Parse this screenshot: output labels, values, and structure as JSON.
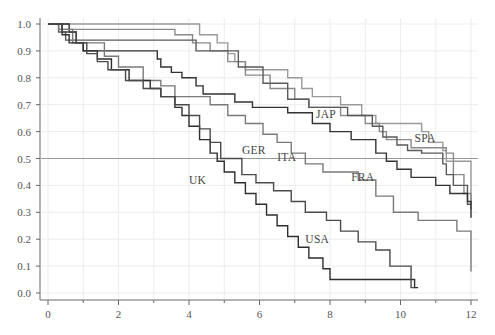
{
  "chart_data": {
    "type": "line",
    "subtype": "step (Kaplan-Meier survival curves)",
    "title": "",
    "xlabel": "",
    "ylabel": "",
    "xlim": [
      0,
      12
    ],
    "ylim": [
      0.0,
      1.0
    ],
    "x_ticks": [
      0,
      2,
      4,
      6,
      8,
      10,
      12
    ],
    "x_minor_ticks": [
      1,
      3,
      5,
      7,
      9,
      11
    ],
    "y_ticks": [
      0.0,
      0.1,
      0.2,
      0.3,
      0.4,
      0.5,
      0.6,
      0.7,
      0.8,
      0.9,
      1.0
    ],
    "x_tick_labels": [
      "0",
      "2",
      "4",
      "6",
      "8",
      "10",
      "12"
    ],
    "y_tick_labels": [
      "0.0",
      "0.1",
      "0.2",
      "0.3",
      "0.4",
      "0.5",
      "0.6",
      "0.7",
      "0.8",
      "0.9",
      "1.0"
    ],
    "grid": true,
    "reference_line": {
      "y": 0.5,
      "color": "#999999"
    },
    "legend": "inline labels",
    "series": [
      {
        "name": "JAP",
        "color": "#9a9a9a",
        "label_pos": [
          7.6,
          0.665
        ],
        "points": [
          [
            0,
            1.0
          ],
          [
            4.3,
            0.96
          ],
          [
            4.8,
            0.93
          ],
          [
            5.1,
            0.89
          ],
          [
            5.3,
            0.86
          ],
          [
            5.6,
            0.83
          ],
          [
            6.8,
            0.8
          ],
          [
            7.2,
            0.76
          ],
          [
            7.5,
            0.73
          ],
          [
            8.3,
            0.7
          ],
          [
            8.9,
            0.66
          ],
          [
            9.3,
            0.63
          ],
          [
            10.6,
            0.6
          ],
          [
            10.8,
            0.56
          ],
          [
            11.2,
            0.53
          ],
          [
            11.3,
            0.49
          ],
          [
            12.0,
            0.43
          ],
          [
            12.0,
            0.33
          ]
        ]
      },
      {
        "name": "SPA",
        "color": "#8a8a8a",
        "label_pos": [
          10.4,
          0.575
        ],
        "points": [
          [
            0,
            1.0
          ],
          [
            0.4,
            0.98
          ],
          [
            3.6,
            0.96
          ],
          [
            4.1,
            0.93
          ],
          [
            4.6,
            0.9
          ],
          [
            5.1,
            0.86
          ],
          [
            5.6,
            0.81
          ],
          [
            6.3,
            0.76
          ],
          [
            7.0,
            0.72
          ],
          [
            7.4,
            0.69
          ],
          [
            8.3,
            0.66
          ],
          [
            9.0,
            0.63
          ],
          [
            9.4,
            0.6
          ],
          [
            9.6,
            0.57
          ],
          [
            10.3,
            0.54
          ],
          [
            11.3,
            0.52
          ],
          [
            11.5,
            0.44
          ],
          [
            11.8,
            0.37
          ],
          [
            12.0,
            0.31
          ]
        ]
      },
      {
        "name": "ITA",
        "color": "#5a5a5a",
        "label_pos": [
          6.5,
          0.505
        ],
        "points": [
          [
            0,
            1.0
          ],
          [
            0.3,
            0.97
          ],
          [
            0.5,
            0.94
          ],
          [
            4.2,
            0.9
          ],
          [
            5.4,
            0.84
          ],
          [
            6.1,
            0.78
          ],
          [
            6.8,
            0.72
          ],
          [
            7.4,
            0.69
          ],
          [
            8.5,
            0.66
          ],
          [
            9.2,
            0.62
          ],
          [
            9.5,
            0.58
          ],
          [
            9.9,
            0.55
          ],
          [
            10.2,
            0.53
          ],
          [
            10.6,
            0.52
          ],
          [
            11.2,
            0.48
          ],
          [
            11.3,
            0.44
          ],
          [
            11.5,
            0.4
          ],
          [
            11.9,
            0.33
          ],
          [
            12.0,
            0.33
          ]
        ]
      },
      {
        "name": "FRA",
        "color": "#333333",
        "label_pos": [
          8.6,
          0.43
        ],
        "points": [
          [
            0,
            1.0
          ],
          [
            0.6,
            0.97
          ],
          [
            0.8,
            0.93
          ],
          [
            1.0,
            0.9
          ],
          [
            3.1,
            0.87
          ],
          [
            3.2,
            0.84
          ],
          [
            3.5,
            0.82
          ],
          [
            3.8,
            0.8
          ],
          [
            4.2,
            0.77
          ],
          [
            4.4,
            0.74
          ],
          [
            5.3,
            0.71
          ],
          [
            5.8,
            0.69
          ],
          [
            6.8,
            0.67
          ],
          [
            7.5,
            0.63
          ],
          [
            8.0,
            0.6
          ],
          [
            8.6,
            0.57
          ],
          [
            9.3,
            0.52
          ],
          [
            9.6,
            0.49
          ],
          [
            9.9,
            0.46
          ],
          [
            10.3,
            0.43
          ],
          [
            11.0,
            0.4
          ],
          [
            11.4,
            0.37
          ],
          [
            11.9,
            0.34
          ],
          [
            12.0,
            0.28
          ]
        ]
      },
      {
        "name": "GER",
        "color": "#7a7a7a",
        "label_pos": [
          5.5,
          0.53
        ],
        "points": [
          [
            0,
            1.0
          ],
          [
            0.3,
            0.98
          ],
          [
            0.7,
            0.93
          ],
          [
            1.6,
            0.88
          ],
          [
            2.0,
            0.84
          ],
          [
            2.7,
            0.79
          ],
          [
            3.2,
            0.77
          ],
          [
            3.6,
            0.73
          ],
          [
            4.6,
            0.7
          ],
          [
            5.1,
            0.66
          ],
          [
            5.6,
            0.63
          ],
          [
            6.1,
            0.59
          ],
          [
            6.5,
            0.56
          ],
          [
            6.9,
            0.52
          ],
          [
            7.3,
            0.48
          ],
          [
            7.8,
            0.45
          ],
          [
            8.8,
            0.42
          ],
          [
            9.3,
            0.36
          ],
          [
            9.8,
            0.3
          ],
          [
            10.5,
            0.27
          ],
          [
            11.6,
            0.23
          ],
          [
            12.0,
            0.2
          ],
          [
            12.0,
            0.08
          ]
        ]
      },
      {
        "name": "UK",
        "color": "#2e2e2e",
        "label_pos": [
          4.0,
          0.42
        ],
        "points": [
          [
            0,
            1.0
          ],
          [
            0.4,
            0.96
          ],
          [
            0.6,
            0.93
          ],
          [
            1.0,
            0.9
          ],
          [
            1.4,
            0.87
          ],
          [
            1.8,
            0.83
          ],
          [
            2.3,
            0.79
          ],
          [
            2.9,
            0.76
          ],
          [
            3.2,
            0.73
          ],
          [
            3.6,
            0.69
          ],
          [
            3.8,
            0.66
          ],
          [
            4.0,
            0.62
          ],
          [
            4.3,
            0.57
          ],
          [
            4.6,
            0.52
          ],
          [
            4.8,
            0.49
          ],
          [
            5.0,
            0.45
          ],
          [
            5.3,
            0.41
          ],
          [
            5.6,
            0.37
          ],
          [
            5.9,
            0.33
          ],
          [
            6.2,
            0.29
          ],
          [
            6.5,
            0.25
          ],
          [
            6.8,
            0.21
          ],
          [
            7.1,
            0.17
          ],
          [
            7.4,
            0.13
          ],
          [
            7.8,
            0.09
          ],
          [
            8.0,
            0.05
          ],
          [
            9.7,
            0.05
          ],
          [
            10.4,
            0.02
          ],
          [
            10.5,
            0.02
          ]
        ]
      },
      {
        "name": "USA",
        "color": "#4a4a4a",
        "label_pos": [
          7.3,
          0.2
        ],
        "points": [
          [
            0,
            1.0
          ],
          [
            0.4,
            0.97
          ],
          [
            0.8,
            0.93
          ],
          [
            1.1,
            0.89
          ],
          [
            1.4,
            0.86
          ],
          [
            1.7,
            0.83
          ],
          [
            2.2,
            0.79
          ],
          [
            2.7,
            0.76
          ],
          [
            3.2,
            0.73
          ],
          [
            3.6,
            0.7
          ],
          [
            4.0,
            0.66
          ],
          [
            4.3,
            0.61
          ],
          [
            4.6,
            0.56
          ],
          [
            4.9,
            0.5
          ],
          [
            5.5,
            0.44
          ],
          [
            5.9,
            0.41
          ],
          [
            6.4,
            0.38
          ],
          [
            6.9,
            0.34
          ],
          [
            7.3,
            0.3
          ],
          [
            7.9,
            0.27
          ],
          [
            8.3,
            0.23
          ],
          [
            8.8,
            0.19
          ],
          [
            9.3,
            0.16
          ],
          [
            9.7,
            0.1
          ],
          [
            10.3,
            0.05
          ],
          [
            10.3,
            0.02
          ],
          [
            10.4,
            0.02
          ]
        ]
      }
    ]
  }
}
